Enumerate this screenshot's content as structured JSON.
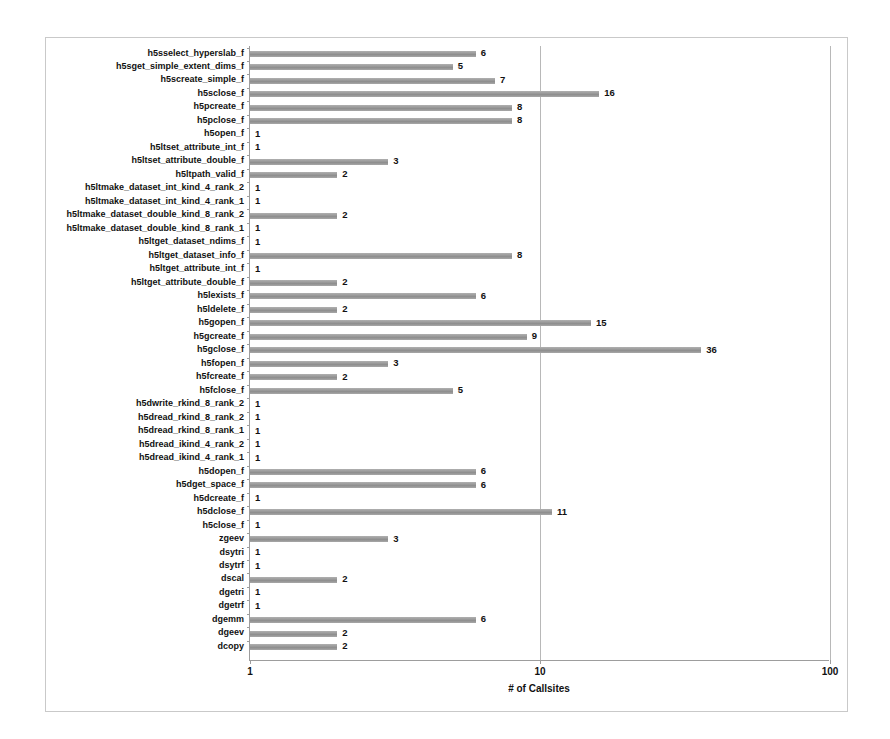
{
  "chart_data": {
    "type": "bar",
    "orientation": "horizontal",
    "title": "",
    "subtitle": "",
    "xlabel": "# of Callsites",
    "ylabel": "",
    "xscale": "log",
    "xlim": [
      1,
      100
    ],
    "xticks": [
      1,
      10,
      100
    ],
    "xticklabels": [
      "1",
      "10",
      "100"
    ],
    "grid": true,
    "grid_axis": "x",
    "legend": null,
    "bar_color": "#9d9d9d",
    "value_labels": true,
    "categories": [
      "h5sselect_hyperslab_f",
      "h5sget_simple_extent_dims_f",
      "h5screate_simple_f",
      "h5sclose_f",
      "h5pcreate_f",
      "h5pclose_f",
      "h5open_f",
      "h5ltset_attribute_int_f",
      "h5ltset_attribute_double_f",
      "h5ltpath_valid_f",
      "h5ltmake_dataset_int_kind_4_rank_2",
      "h5ltmake_dataset_int_kind_4_rank_1",
      "h5ltmake_dataset_double_kind_8_rank_2",
      "h5ltmake_dataset_double_kind_8_rank_1",
      "h5ltget_dataset_ndims_f",
      "h5ltget_dataset_info_f",
      "h5ltget_attribute_int_f",
      "h5ltget_attribute_double_f",
      "h5lexists_f",
      "h5ldelete_f",
      "h5gopen_f",
      "h5gcreate_f",
      "h5gclose_f",
      "h5fopen_f",
      "h5fcreate_f",
      "h5fclose_f",
      "h5dwrite_rkind_8_rank_2",
      "h5dread_rkind_8_rank_2",
      "h5dread_rkind_8_rank_1",
      "h5dread_ikind_4_rank_2",
      "h5dread_ikind_4_rank_1",
      "h5dopen_f",
      "h5dget_space_f",
      "h5dcreate_f",
      "h5dclose_f",
      "h5close_f",
      "zgeev",
      "dsytri",
      "dsytrf",
      "dscal",
      "dgetri",
      "dgetrf",
      "dgemm",
      "dgeev",
      "dcopy"
    ],
    "values": [
      6,
      5,
      7,
      16,
      8,
      8,
      1,
      1,
      3,
      2,
      1,
      1,
      2,
      1,
      1,
      8,
      1,
      2,
      6,
      2,
      15,
      9,
      36,
      3,
      2,
      5,
      1,
      1,
      1,
      1,
      1,
      6,
      6,
      1,
      11,
      1,
      3,
      1,
      1,
      2,
      1,
      1,
      6,
      2,
      2
    ]
  }
}
